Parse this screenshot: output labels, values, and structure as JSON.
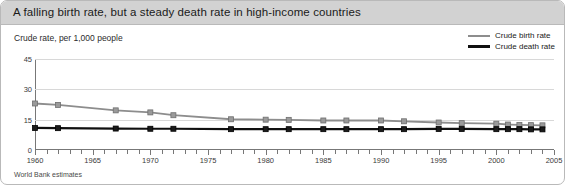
{
  "title": "A falling birth rate, but a steady death rate in high-income countries",
  "footer": "World Bank estimates",
  "legend": {
    "birth": "Crude birth rate",
    "death": "Crude death rate"
  },
  "colors": {
    "birth_line": "#8d8d8d",
    "death_line": "#101010",
    "header_band": "#d2d2d2",
    "grid": "#d8d8d8",
    "axis": "#777777"
  },
  "chart_data": {
    "type": "line",
    "title": "A falling birth rate, but a steady death rate in high-income countries",
    "subtitle": "",
    "xlabel": "",
    "ylabel": "Crude rate, per 1,000 people",
    "source": "World Bank estimates",
    "xlim": [
      1960,
      2005
    ],
    "ylim": [
      0,
      45
    ],
    "yticks": [
      0,
      15,
      30,
      45
    ],
    "xticks": [
      1960,
      1965,
      1970,
      1975,
      1980,
      1985,
      1990,
      1995,
      2000,
      2005
    ],
    "xtick_minor_step": 1,
    "grid": true,
    "legend_position": "top-right",
    "x": [
      1960,
      1962,
      1967,
      1970,
      1972,
      1977,
      1980,
      1982,
      1985,
      1987,
      1990,
      1992,
      1995,
      1997,
      2000,
      2001,
      2002,
      2003,
      2004
    ],
    "series": [
      {
        "name": "Crude birth rate",
        "marker": "square",
        "color": "#8d8d8d",
        "values": [
          23.0,
          22.3,
          19.6,
          18.6,
          17.2,
          15.2,
          15.0,
          14.9,
          14.6,
          14.6,
          14.6,
          14.2,
          13.6,
          13.3,
          13.0,
          12.6,
          12.4,
          12.3,
          12.2
        ]
      },
      {
        "name": "Crude death rate",
        "marker": "square",
        "color": "#101010",
        "values": [
          10.9,
          10.8,
          10.6,
          10.5,
          10.5,
          10.3,
          10.3,
          10.3,
          10.3,
          10.3,
          10.3,
          10.3,
          10.4,
          10.4,
          10.3,
          10.3,
          10.3,
          10.2,
          10.2
        ]
      }
    ]
  }
}
